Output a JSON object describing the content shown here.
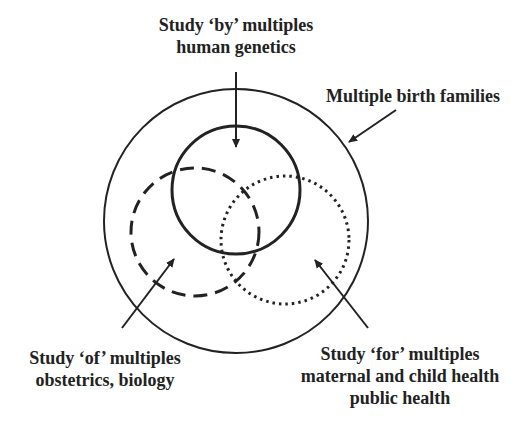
{
  "labels": {
    "by": {
      "title": "Study ‘by’ multiples",
      "sub": "human genetics"
    },
    "families": {
      "title": "Multiple birth families"
    },
    "of": {
      "title": "Study ‘of’ multiples",
      "sub": "obstetrics, biology"
    },
    "for": {
      "title": "Study ‘for’ multiples",
      "sub1": "maternal and child health",
      "sub2": "public health"
    }
  },
  "circles": [
    {
      "name": "multiple-birth-families",
      "style": "solid-thin",
      "cx": 236,
      "cy": 221,
      "r": 132
    },
    {
      "name": "study-by-multiples",
      "style": "solid-thick",
      "cx": 236,
      "cy": 190,
      "r": 64
    },
    {
      "name": "study-of-multiples",
      "style": "dashed",
      "cx": 195,
      "cy": 232,
      "r": 64
    },
    {
      "name": "study-for-multiples",
      "style": "dotted",
      "cx": 285,
      "cy": 240,
      "r": 64
    }
  ],
  "colors": {
    "stroke": "#222222",
    "background": "#ffffff"
  }
}
